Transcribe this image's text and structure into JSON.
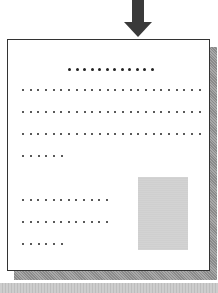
{
  "diagram": {
    "arrow": {
      "direction": "down",
      "color": "#3a3a3a"
    },
    "page": {
      "border_color": "#333333",
      "shadow_color": "#9a9a9a"
    },
    "title_line": {
      "dot_count": 12
    },
    "text_lines": [
      {
        "dot_count": 24
      },
      {
        "dot_count": 24
      },
      {
        "dot_count": 24
      },
      {
        "dot_count": 6
      },
      {
        "dot_count": 12
      },
      {
        "dot_count": 12
      },
      {
        "dot_count": 6
      }
    ],
    "image_placeholder": {
      "color": "#d0d0d0"
    },
    "bottom_bar": {
      "color": "#c4c4c4"
    }
  }
}
